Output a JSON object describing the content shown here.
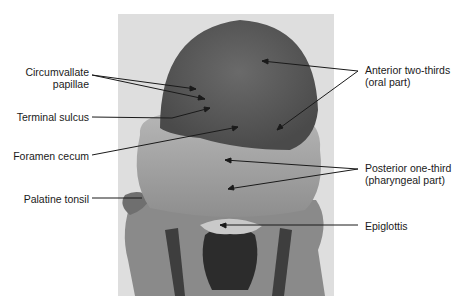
{
  "figure": {
    "colors": {
      "background": "#ffffff",
      "photo_backdrop": "#dedede",
      "anterior_tongue": "#5a5a5a",
      "posterior_tongue": "#a8a8a8",
      "leader_line": "#1a1a1a"
    }
  },
  "labels": {
    "left": [
      {
        "id": "circumvallate",
        "line1": "Circumvallate",
        "line2": "papillae"
      },
      {
        "id": "terminal-sulcus",
        "line1": "Terminal sulcus"
      },
      {
        "id": "foramen-cecum",
        "line1": "Foramen cecum"
      },
      {
        "id": "palatine-tonsil",
        "line1": "Palatine tonsil"
      }
    ],
    "right": [
      {
        "id": "anterior",
        "line1": "Anterior two-thirds",
        "line2": "(oral part)"
      },
      {
        "id": "posterior",
        "line1": "Posterior one-third",
        "line2": "(pharyngeal part)"
      },
      {
        "id": "epiglottis",
        "line1": "Epiglottis"
      }
    ]
  }
}
